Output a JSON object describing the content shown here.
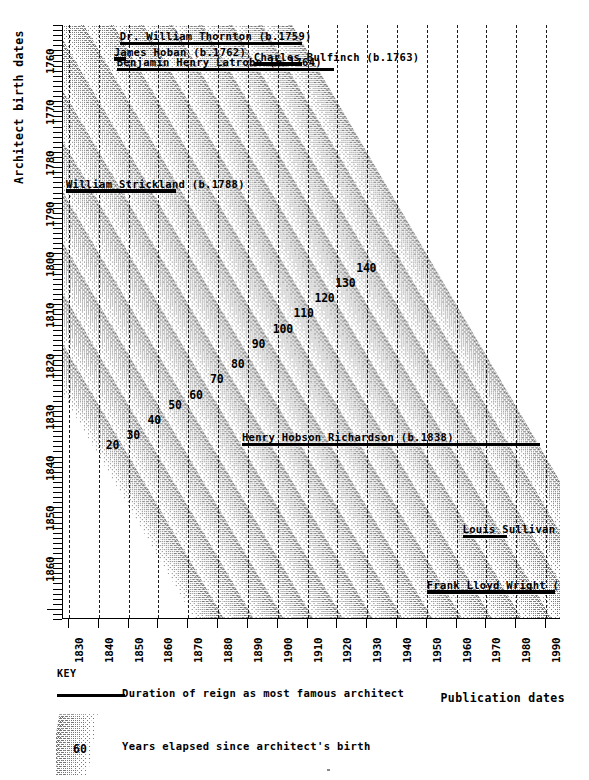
{
  "chart_data": {
    "type": "area",
    "title": "",
    "xlabel": "Publication dates",
    "ylabel": "Architect birth dates",
    "xlim": [
      1828,
      1995
    ],
    "ylim": [
      1755,
      1872
    ],
    "xticks": [
      1830,
      1840,
      1850,
      1860,
      1870,
      1880,
      1890,
      1900,
      1910,
      1920,
      1930,
      1940,
      1950,
      1960,
      1970,
      1980,
      1990
    ],
    "yticks": [
      1760,
      1770,
      1780,
      1790,
      1800,
      1810,
      1820,
      1830,
      1840,
      1850,
      1860
    ],
    "grid": "vertical dashed decade lines",
    "legend": "bottom KEY block",
    "band_series": {
      "name": "Years elapsed since architect's birth",
      "note": "Diagonal stippled bands; each band labelled with the age in years (publication date minus architect birth date)",
      "labels": [
        20,
        30,
        40,
        50,
        60,
        70,
        80,
        90,
        100,
        110,
        120,
        130,
        140
      ],
      "label_positions": [
        {
          "value": 20,
          "x": 1845,
          "y": 1838
        },
        {
          "value": 30,
          "x": 1852,
          "y": 1836
        },
        {
          "value": 40,
          "x": 1859,
          "y": 1833
        },
        {
          "value": 50,
          "x": 1866,
          "y": 1830
        },
        {
          "value": 60,
          "x": 1873,
          "y": 1828
        },
        {
          "value": 70,
          "x": 1880,
          "y": 1825
        },
        {
          "value": 80,
          "x": 1887,
          "y": 1822
        },
        {
          "value": 90,
          "x": 1894,
          "y": 1818
        },
        {
          "value": 100,
          "x": 1901,
          "y": 1815
        },
        {
          "value": 110,
          "x": 1908,
          "y": 1812
        },
        {
          "value": 120,
          "x": 1915,
          "y": 1809
        },
        {
          "value": 130,
          "x": 1922,
          "y": 1806
        },
        {
          "value": 140,
          "x": 1929,
          "y": 1803
        }
      ]
    },
    "architects": [
      {
        "label": "Dr. William Thornton (b.1759)",
        "birth_year": 1759,
        "reign_start": 1847,
        "reign_end": 1908
      },
      {
        "label": "James Hoban (b.1762)",
        "birth_year": 1762,
        "reign_start": 1845,
        "reign_end": 1849
      },
      {
        "label": "Charles Bulfinch (b.1763)",
        "birth_year": 1763,
        "reign_start": 1892,
        "reign_end": 1908
      },
      {
        "label": "Benjamin Henry Latrobe (b.1764)",
        "birth_year": 1764,
        "reign_start": 1846,
        "reign_end": 1919
      },
      {
        "label": "William Strickland (b.1788)",
        "birth_year": 1788,
        "reign_start": 1829,
        "reign_end": 1866
      },
      {
        "label": "Henry Hobson Richardson (b.1838)",
        "birth_year": 1838,
        "reign_start": 1888,
        "reign_end": 1988
      },
      {
        "label": "Louis Sullivan (b.1856)",
        "birth_year": 1856,
        "reign_start": 1962,
        "reign_end": 1977
      },
      {
        "label": "Frank Lloyd Wright (b.1867)",
        "birth_year": 1867,
        "reign_start": 1950,
        "reign_end": 1993
      }
    ]
  },
  "axes": {
    "y_title": "Architect birth dates",
    "x_title": "Publication dates",
    "y_labels": [
      "1760",
      "1770",
      "1780",
      "1790",
      "1800",
      "1810",
      "1820",
      "1830",
      "1840",
      "1850",
      "1860"
    ],
    "x_labels": [
      "1830",
      "1840",
      "1850",
      "1860",
      "1870",
      "1880",
      "1890",
      "1900",
      "1910",
      "1920",
      "1930",
      "1940",
      "1950",
      "1960",
      "1970",
      "1980",
      "1990"
    ]
  },
  "key": {
    "title": "KEY",
    "line_entry": "Duration of reign as most famous architect",
    "swatch_entry": "Years elapsed since architect's birth",
    "swatch_number": "60"
  },
  "colors": {
    "ink": "#000000",
    "stipple": "#767676",
    "background": "#ffffff"
  }
}
